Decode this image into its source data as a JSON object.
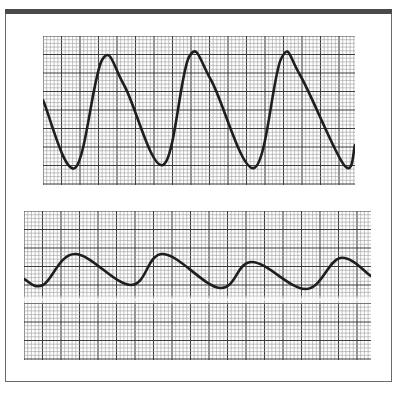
{
  "frame": {
    "border_color": "#6a6a6a",
    "topbar_color": "#4a4a4a"
  },
  "grid": {
    "minor_color": "#9a9a9a",
    "major_color": "#3c3c3c",
    "minor_spacing_px": 3.7,
    "major_every_minor": 5
  },
  "trace_color": "#1e1e1e",
  "chart_data": [
    {
      "type": "line",
      "title": "",
      "xlabel": "",
      "ylabel": "",
      "description": "Upper tracing: large-amplitude sawtooth-like pulsatile waveform on graph paper (rapid upstroke, peak, shoulder, slow decline to trough)",
      "grid": true,
      "legend": null,
      "xlim": [
        0,
        312
      ],
      "ylim": [
        149,
        0
      ],
      "x": [
        0,
        32,
        59,
        81,
        120,
        146,
        168,
        211,
        238,
        257,
        301,
        312
      ],
      "series": [
        {
          "name": "upper-trace",
          "values": [
            64,
            132,
            24,
            49,
            129,
            21,
            44,
            132,
            23,
            39,
            129,
            109
          ]
        }
      ],
      "features": {
        "peaks_x": [
          59,
          146,
          238
        ],
        "troughs_x": [
          32,
          120,
          211,
          301
        ]
      }
    },
    {
      "type": "line",
      "title": "",
      "xlabel": "",
      "ylabel": "",
      "description": "Lower tracing: low-amplitude smooth periodic waveform on graph paper with a faint blurred horizontal band below the trace",
      "grid": true,
      "legend": null,
      "xlim": [
        0,
        347
      ],
      "ylim": [
        149,
        0
      ],
      "x": [
        0,
        19,
        51,
        107,
        139,
        196,
        228,
        282,
        316,
        347
      ],
      "series": [
        {
          "name": "lower-trace",
          "values": [
            68,
            74,
            43,
            74,
            43,
            77,
            51,
            78,
            47,
            65
          ]
        }
      ],
      "features": {
        "peaks_x": [
          51,
          139,
          228,
          316
        ],
        "troughs_x": [
          19,
          107,
          196,
          282
        ]
      }
    }
  ]
}
